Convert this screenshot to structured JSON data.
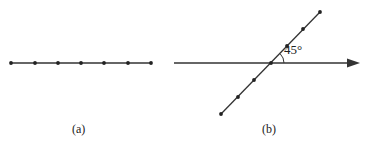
{
  "figure": {
    "colors": {
      "line": "#333333",
      "dot": "#222222",
      "background": "#ffffff"
    },
    "panel_a": {
      "caption": "(a)",
      "line": {
        "x1": 11,
        "y1": 63,
        "x2": 151,
        "y2": 63
      },
      "points": [
        {
          "x": 11,
          "y": 63
        },
        {
          "x": 35,
          "y": 63
        },
        {
          "x": 58,
          "y": 63
        },
        {
          "x": 81,
          "y": 63
        },
        {
          "x": 104,
          "y": 63
        },
        {
          "x": 128,
          "y": 63
        },
        {
          "x": 151,
          "y": 63
        }
      ]
    },
    "panel_b": {
      "caption": "(b)",
      "angle_label": "45°",
      "axis_arrow": {
        "x1": 174,
        "y1": 63,
        "x2": 360,
        "y2": 63
      },
      "diagonal_line": {
        "x1": 221,
        "y1": 114,
        "x2": 320,
        "y2": 12
      },
      "points": [
        {
          "x": 320,
          "y": 12
        },
        {
          "x": 303,
          "y": 29
        },
        {
          "x": 287,
          "y": 46
        },
        {
          "x": 271,
          "y": 63
        },
        {
          "x": 254,
          "y": 80
        },
        {
          "x": 238,
          "y": 97
        },
        {
          "x": 221,
          "y": 114
        }
      ]
    }
  }
}
